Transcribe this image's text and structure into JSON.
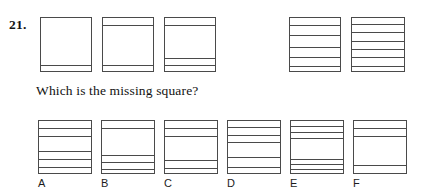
{
  "question": {
    "number": "21.",
    "prompt": "Which is the missing square?"
  },
  "puzzle_type": "missing-square-sequence",
  "sequence": {
    "caption": "",
    "squares": [
      {
        "position": 1,
        "line_count": 1,
        "lines_pct": [
          85
        ],
        "missing": false,
        "box": {
          "x": 40,
          "y": 17,
          "w": 52,
          "h": 55
        }
      },
      {
        "position": 2,
        "line_count": 2,
        "lines_pct": [
          13,
          85
        ],
        "missing": false,
        "box": {
          "x": 102,
          "y": 17,
          "w": 52,
          "h": 55
        }
      },
      {
        "position": 3,
        "line_count": 3,
        "lines_pct": [
          13,
          73,
          86
        ],
        "missing": false,
        "box": {
          "x": 164,
          "y": 17,
          "w": 52,
          "h": 55
        }
      },
      {
        "position": 4,
        "line_count": 4,
        "lines_pct": [],
        "missing": true,
        "box": {
          "x": 226,
          "y": 17,
          "w": 52,
          "h": 55
        }
      },
      {
        "position": 5,
        "line_count": 5,
        "lines_pct": [
          12,
          30,
          52,
          70,
          87
        ],
        "missing": false,
        "box": {
          "x": 289,
          "y": 17,
          "w": 52,
          "h": 55
        }
      },
      {
        "position": 6,
        "line_count": 6,
        "lines_pct": [
          11,
          26,
          41,
          56,
          71,
          87
        ],
        "missing": false,
        "box": {
          "x": 351,
          "y": 17,
          "w": 54,
          "h": 55
        }
      }
    ]
  },
  "options": [
    {
      "label": "A",
      "line_count": 5,
      "lines_pct": [
        13,
        27,
        56,
        71,
        86
      ],
      "box": {
        "x": 38,
        "y": 120,
        "w": 54,
        "h": 54
      },
      "label_pos": {
        "x": 38,
        "y": 177
      }
    },
    {
      "label": "B",
      "line_count": 4,
      "lines_pct": [
        13,
        63,
        76,
        88
      ],
      "box": {
        "x": 101,
        "y": 120,
        "w": 54,
        "h": 54
      },
      "label_pos": {
        "x": 101,
        "y": 177
      }
    },
    {
      "label": "C",
      "line_count": 4,
      "lines_pct": [
        13,
        28,
        73,
        87
      ],
      "box": {
        "x": 164,
        "y": 120,
        "w": 54,
        "h": 54
      },
      "label_pos": {
        "x": 164,
        "y": 177
      }
    },
    {
      "label": "D",
      "line_count": 5,
      "lines_pct": [
        12,
        25,
        39,
        66,
        86
      ],
      "box": {
        "x": 227,
        "y": 120,
        "w": 54,
        "h": 54
      },
      "label_pos": {
        "x": 227,
        "y": 177
      }
    },
    {
      "label": "E",
      "line_count": 6,
      "lines_pct": [
        10,
        20,
        31,
        70,
        79,
        88
      ],
      "box": {
        "x": 290,
        "y": 120,
        "w": 54,
        "h": 54
      },
      "label_pos": {
        "x": 290,
        "y": 177
      }
    },
    {
      "label": "F",
      "line_count": 3,
      "lines_pct": [
        13,
        28,
        82
      ],
      "box": {
        "x": 353,
        "y": 120,
        "w": 54,
        "h": 54
      },
      "label_pos": {
        "x": 353,
        "y": 177
      }
    }
  ],
  "colors": {
    "page_background": "#ffffff",
    "ink": "#1a1a1a",
    "square_stroke": "#4a4a4a"
  }
}
